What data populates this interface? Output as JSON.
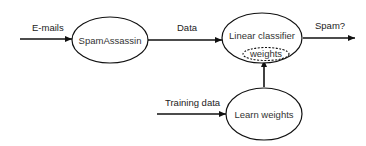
{
  "diagram": {
    "nodes": {
      "spamassassin": "SpamAssassin",
      "classifier": "Linear classifier",
      "weights": "weights",
      "learn": "Learn weights"
    },
    "edges": {
      "emails": "E-mails",
      "data": "Data",
      "spam": "Spam?",
      "training": "Training data"
    },
    "colors": {
      "stroke": "#111111",
      "text": "#333333",
      "background": "#ffffff"
    }
  }
}
